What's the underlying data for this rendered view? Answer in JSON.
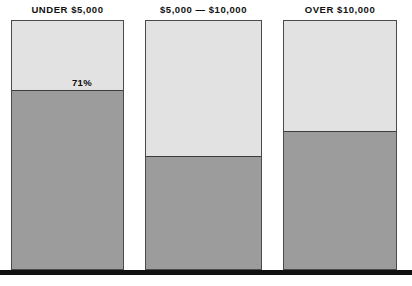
{
  "chart_data": {
    "type": "bar",
    "title": "",
    "subtitle": "",
    "xlabel": "",
    "ylabel": "",
    "ylim": [
      0,
      100
    ],
    "grid": false,
    "legend_position": "none",
    "stacked": true,
    "units": "percent",
    "categories": [
      "UNDER $5,000",
      "$5,000 — $10,000",
      "OVER $10,000"
    ],
    "series": [
      {
        "name": "lower-segment",
        "values": [
          71,
          45,
          54
        ],
        "color": "#9c9c9c"
      },
      {
        "name": "upper-segment",
        "values": [
          29,
          55,
          46
        ],
        "color": "#e2e2e2"
      }
    ],
    "data_labels": [
      "71%",
      "45%",
      "54%"
    ],
    "annotations": []
  },
  "canvas": {
    "background": "#ffffff",
    "baseline_color": "#111111"
  },
  "bars": [
    {
      "id": "bar-under-5000",
      "label": "UNDER $5,000",
      "value_label": "71%",
      "value": 71,
      "light_color": "#e2e2e2",
      "dark_color": "#9c9c9c",
      "geom": {
        "left": 11,
        "width": 113,
        "top": 20,
        "bottom": 270,
        "divider": 91
      },
      "label_offset": {
        "right": 50,
        "bottom": 2
      }
    },
    {
      "id": "bar-5000-10000",
      "label": "$5,000 — $10,000",
      "value_label": "45%",
      "value": 45,
      "light_color": "#e2e2e2",
      "dark_color": "#9c9c9c",
      "geom": {
        "left": 145,
        "width": 117,
        "top": 20,
        "bottom": 270,
        "divider": 157
      },
      "label_offset": {
        "right": 48,
        "bottom": 2
      }
    },
    {
      "id": "bar-over-10000",
      "label": "OVER $10,000",
      "value_label": "54%",
      "value": 54,
      "light_color": "#e2e2e2",
      "dark_color": "#9c9c9c",
      "geom": {
        "left": 283,
        "width": 114,
        "top": 20,
        "bottom": 270,
        "divider": 132
      },
      "label_offset": {
        "right": 42,
        "bottom": 2
      }
    }
  ],
  "baseline": {
    "top": 270,
    "height": 5
  }
}
